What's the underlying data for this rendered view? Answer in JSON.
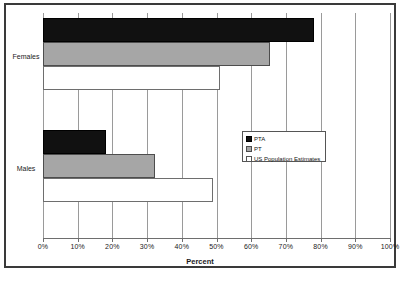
{
  "chart_data": {
    "type": "bar",
    "orientation": "horizontal",
    "title": "",
    "xlabel": "Percent",
    "ylabel": "",
    "xlim": [
      0,
      100
    ],
    "xticks": [
      "0%",
      "10%",
      "20%",
      "30%",
      "40%",
      "50%",
      "60%",
      "70%",
      "80%",
      "90%",
      "100%"
    ],
    "xtick_values": [
      0,
      10,
      20,
      30,
      40,
      50,
      60,
      70,
      80,
      90,
      100
    ],
    "categories": [
      "Females",
      "Males"
    ],
    "grid": "vertical",
    "legend_position": "center-right-inside",
    "series": [
      {
        "name": "PTA",
        "color": "#111111",
        "values": [
          78.0,
          18.2
        ]
      },
      {
        "name": "PT",
        "color": "#a6a6a6",
        "values": [
          65.5,
          32.3
        ]
      },
      {
        "name": "US Population Estimates",
        "color": "#ffffff",
        "values": [
          50.9,
          49.1
        ]
      }
    ]
  },
  "legend": {
    "items": [
      {
        "label": "PTA"
      },
      {
        "label": "PT"
      },
      {
        "label": "US Population Estimates"
      }
    ]
  },
  "colors": {
    "frame": "#3a3a3a",
    "gridline": "#9a9a9a",
    "axis": "#6e6e6e"
  }
}
